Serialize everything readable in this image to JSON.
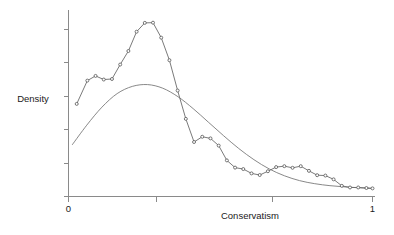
{
  "chart_data": {
    "type": "line",
    "title": "",
    "subtitle": "",
    "xlabel": "Conservatism",
    "ylabel": "Density",
    "xlim": [
      0,
      1
    ],
    "ylim": [
      0,
      1
    ],
    "grid": false,
    "legend": "none",
    "x_tick_labels": [
      "0",
      "",
      "",
      "1"
    ],
    "x_tick_values": [
      0,
      0.29,
      0.67,
      1
    ],
    "y_tick_labels": [
      "",
      "",
      "",
      "",
      "",
      ""
    ],
    "y_tick_values": [
      0.0,
      0.185,
      0.37,
      0.555,
      0.74,
      0.925
    ],
    "annotations": [],
    "series": [
      {
        "name": "empirical-density",
        "style": "line-with-markers",
        "marker": "open-circle",
        "color": "#6b6b6b",
        "x": [
          0.027,
          0.062,
          0.089,
          0.116,
          0.143,
          0.17,
          0.197,
          0.224,
          0.251,
          0.278,
          0.305,
          0.332,
          0.359,
          0.386,
          0.413,
          0.44,
          0.467,
          0.494,
          0.521,
          0.548,
          0.575,
          0.602,
          0.629,
          0.656,
          0.683,
          0.71,
          0.737,
          0.764,
          0.791,
          0.818,
          0.845,
          0.872,
          0.899,
          0.926,
          0.953,
          0.98,
          1.0
        ],
        "y": [
          0.513,
          0.642,
          0.668,
          0.648,
          0.651,
          0.731,
          0.806,
          0.913,
          0.962,
          0.963,
          0.88,
          0.755,
          0.587,
          0.43,
          0.302,
          0.331,
          0.322,
          0.282,
          0.2,
          0.16,
          0.152,
          0.128,
          0.119,
          0.14,
          0.163,
          0.168,
          0.159,
          0.168,
          0.142,
          0.118,
          0.116,
          0.095,
          0.059,
          0.05,
          0.05,
          0.047,
          0.045
        ]
      },
      {
        "name": "fitted-normal-curve",
        "style": "smooth-line",
        "marker": "none",
        "color": "#7a7a7a",
        "x": [
          0.013,
          0.06,
          0.11,
          0.16,
          0.21,
          0.26,
          0.31,
          0.36,
          0.41,
          0.46,
          0.51,
          0.56,
          0.61,
          0.66,
          0.71,
          0.76,
          0.81,
          0.86,
          0.91,
          0.96,
          1.0
        ],
        "y": [
          0.288,
          0.395,
          0.495,
          0.57,
          0.61,
          0.62,
          0.6,
          0.553,
          0.487,
          0.412,
          0.337,
          0.266,
          0.204,
          0.153,
          0.115,
          0.088,
          0.071,
          0.06,
          0.053,
          0.048,
          0.045
        ]
      }
    ]
  },
  "axes": {
    "x_axis_label": "Conservatism",
    "y_axis_label": "Density"
  }
}
